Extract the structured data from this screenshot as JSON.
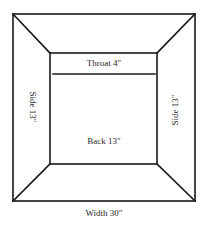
{
  "diagram": {
    "type": "fireplace-plan",
    "labels": {
      "throat": "Throat 4″",
      "back": "Back 13″",
      "side_left": "Side 13″",
      "side_right": "Side 13″",
      "width": "Width 30″"
    },
    "dimensions": {
      "width_in": 30,
      "back_in": 13,
      "side_in": 13,
      "throat_in": 4
    },
    "colors": {
      "line": "#1a1a1a",
      "text": "#2a2a2a",
      "background": "#ffffff"
    }
  }
}
